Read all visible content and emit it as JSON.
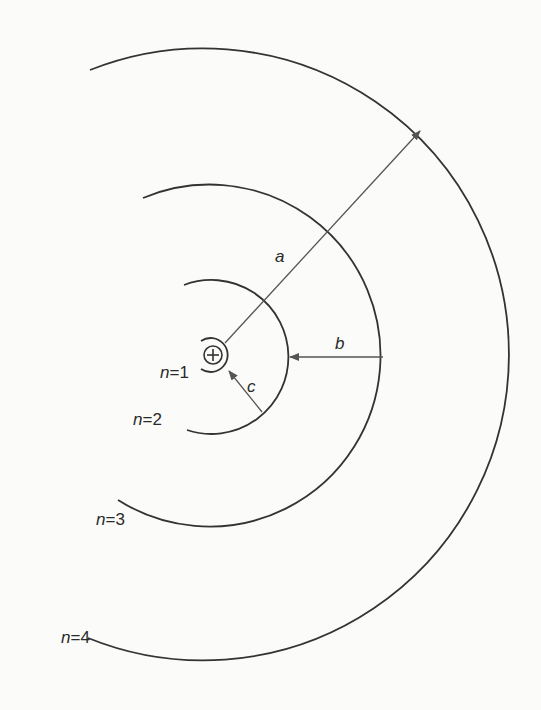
{
  "diagram": {
    "type": "bohr-model-orbits",
    "nucleus": {
      "cx": 213,
      "cy": 355,
      "symbol": "⊕",
      "r": 9
    },
    "colors": {
      "orbit": "#333333",
      "arrow": "#555555",
      "text": "#2a2a2a",
      "background": "#fbfbf9"
    },
    "orbits": [
      {
        "n": 1,
        "label": "n=1",
        "label_n": "n",
        "label_rest": "=1",
        "path": "M 201 341 A 17 17 0 1 1 201 369",
        "label_x": 160,
        "label_y": 378
      },
      {
        "n": 2,
        "label": "n=2",
        "label_n": "n",
        "label_rest": "=2",
        "path": "M 184 285 A 77 77 0 1 1 187 430",
        "label_x": 133,
        "label_y": 425
      },
      {
        "n": 3,
        "label": "n=3",
        "label_n": "n",
        "label_rest": "=3",
        "path": "M 143 198 A 171 171 0 1 1 118 500",
        "label_x": 96,
        "label_y": 525
      },
      {
        "n": 4,
        "label": "n=4",
        "label_n": "n",
        "label_rest": "=4",
        "path": "M 90 70 A 306 306 0 1 1 88 638",
        "label_x": 61,
        "label_y": 643
      }
    ],
    "arrows": [
      {
        "name": "a",
        "label": "a",
        "x1": 225,
        "y1": 343,
        "x2": 420,
        "y2": 131,
        "label_x": 275,
        "label_y": 262
      },
      {
        "name": "b",
        "label": "b",
        "x1": 383,
        "y1": 357,
        "x2": 290,
        "y2": 357,
        "label_x": 335,
        "label_y": 349
      },
      {
        "name": "c",
        "label": "c",
        "x1": 262,
        "y1": 412,
        "x2": 229,
        "y2": 371,
        "label_x": 247,
        "label_y": 392
      }
    ]
  }
}
